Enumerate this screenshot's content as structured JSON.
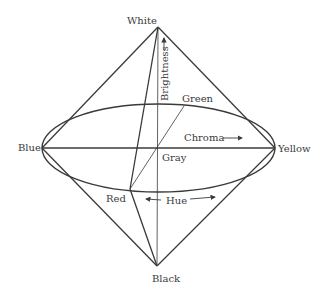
{
  "diagram": {
    "labels": {
      "white": "White",
      "black": "Black",
      "blue": "Blue",
      "yellow": "Yellow",
      "green": "Green",
      "red": "Red",
      "gray": "Gray",
      "brightness": "Brightness",
      "chroma": "Chroma",
      "hue": "Hue"
    },
    "colors": {
      "line": "#3a3a3a",
      "text": "#3a3a3a",
      "background": "#ffffff"
    }
  }
}
